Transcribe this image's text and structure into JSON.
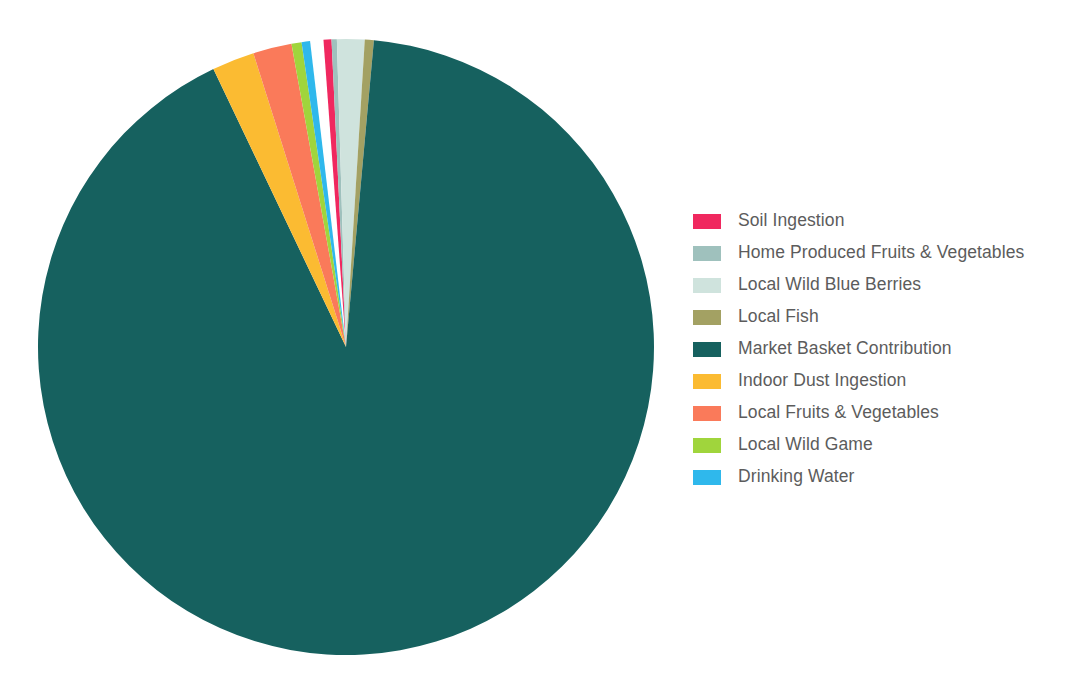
{
  "chart_data": {
    "type": "pie",
    "title": "",
    "subtitle": "",
    "xlabel": "",
    "ylabel": "",
    "grid": false,
    "legend_position": "right",
    "units": "percent of total exposure",
    "start_angle_deg": 337.0,
    "direction": "clockwise",
    "categories": [
      "Soil Ingestion",
      "Home Produced Fruits & Vegetables",
      "Local Wild Blue Berries",
      "Local Fish",
      "Market Basket Contribution",
      "Indoor Dust Ingestion",
      "Local Fruits & Vegetables",
      "Local Wild Game",
      "Drinking Water"
    ],
    "values": [
      0.42,
      0.28,
      1.44,
      0.47,
      91.46,
      2.22,
      2.03,
      0.53,
      0.45
    ],
    "colors": [
      "#f0285f",
      "#9fc1bd",
      "#cfe3dd",
      "#a3a163",
      "#16615f",
      "#fbbb32",
      "#fa7a5a",
      "#a0d53c",
      "#2fb8ec"
    ],
    "slices": [
      {
        "label": "Soil Ingestion",
        "value": 0.42,
        "color": "#f0285f",
        "start_deg": 355.8,
        "end_deg": 357.3
      },
      {
        "label": "Home Produced Fruits & Vegetables",
        "value": 0.28,
        "color": "#9fc1bd",
        "start_deg": 357.3,
        "end_deg": 358.3
      },
      {
        "label": "Local Wild Blue Berries",
        "value": 1.44,
        "color": "#cfe3dd",
        "start_deg": 358.3,
        "end_deg": 363.5
      },
      {
        "label": "Local Fish",
        "value": 0.47,
        "color": "#a3a163",
        "start_deg": 363.5,
        "end_deg": 365.2
      },
      {
        "label": "Market Basket Contribution",
        "value": 91.46,
        "color": "#16615f",
        "start_deg": 365.2,
        "end_deg": 694.5
      },
      {
        "label": "Indoor Dust Ingestion",
        "value": 2.22,
        "color": "#fbbb32",
        "start_deg": 694.5,
        "end_deg": 702.5
      },
      {
        "label": "Local Fruits & Vegetables",
        "value": 2.03,
        "color": "#fa7a5a",
        "start_deg": 702.5,
        "end_deg": 709.8
      },
      {
        "label": "Local Wild Game",
        "value": 0.53,
        "color": "#a0d53c",
        "start_deg": 709.8,
        "end_deg": 711.7
      },
      {
        "label": "Drinking Water",
        "value": 0.45,
        "color": "#2fb8ec",
        "start_deg": 711.7,
        "end_deg": 713.3
      }
    ],
    "geometry": {
      "center_x": 346,
      "center_y": 347,
      "radius": 308
    }
  },
  "legend": {
    "items": [
      {
        "label": "Soil Ingestion",
        "color": "#f0285f"
      },
      {
        "label": "Home Produced Fruits & Vegetables",
        "color": "#9fc1bd"
      },
      {
        "label": "Local Wild Blue Berries",
        "color": "#cfe3dd"
      },
      {
        "label": "Local Fish",
        "color": "#a3a163"
      },
      {
        "label": "Market Basket Contribution",
        "color": "#16615f"
      },
      {
        "label": "Indoor Dust Ingestion",
        "color": "#fbbb32"
      },
      {
        "label": "Local Fruits & Vegetables",
        "color": "#fa7a5a"
      },
      {
        "label": "Local Wild Game",
        "color": "#a0d53c"
      },
      {
        "label": "Drinking Water",
        "color": "#2fb8ec"
      }
    ]
  },
  "theme": {
    "background": "#ffffff",
    "legend_text_color": "#5c5c5c"
  }
}
